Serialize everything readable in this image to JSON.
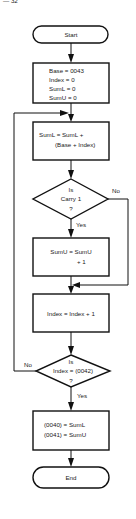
{
  "page_number": "— 32",
  "flowchart": {
    "start": {
      "label": "Start"
    },
    "init": {
      "lines": [
        "Base = 0043",
        "Index = 0",
        "SumL = 0",
        "SumU = 0"
      ]
    },
    "sum_low": {
      "lines": [
        "SumL = SumL +",
        "(Base + Index)"
      ]
    },
    "carry_decision": {
      "lines": [
        "Is",
        "Carry 1",
        "?"
      ],
      "yes_label": "Yes",
      "no_label": "No"
    },
    "sum_high": {
      "lines": [
        "SumU = SumU",
        "+ 1"
      ]
    },
    "increment": {
      "lines": [
        "Index = Index + 1"
      ]
    },
    "index_decision": {
      "lines": [
        "Is",
        "Index = (0042)",
        "?"
      ],
      "yes_label": "Yes",
      "no_label": "No"
    },
    "store": {
      "lines": [
        "(0040) = SumL",
        "(0041) = SumU"
      ]
    },
    "end": {
      "label": "End"
    }
  }
}
